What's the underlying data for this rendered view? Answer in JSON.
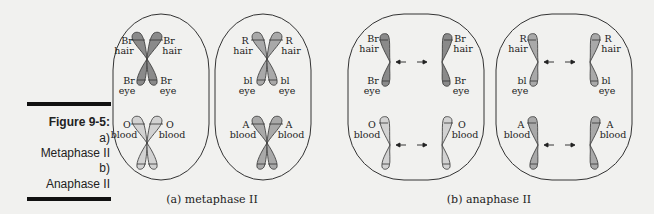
{
  "figure": {
    "number": "Figure 9-5:",
    "lines": [
      "a)",
      "Metaphase II",
      "b)",
      "Anaphase II"
    ]
  },
  "panels": {
    "metaphase": {
      "caption": "(a) metaphase II",
      "cells": [
        {
          "hair": [
            "Br",
            "hair"
          ],
          "eye": [
            "Br",
            "eye"
          ],
          "blood": [
            "O",
            "blood"
          ]
        },
        {
          "hair": [
            "R",
            "hair"
          ],
          "eye": [
            "bl",
            "eye"
          ],
          "blood": [
            "A",
            "blood"
          ]
        }
      ]
    },
    "anaphase": {
      "caption": "(b) anaphase II",
      "cells": [
        {
          "hair": [
            "Br",
            "hair"
          ],
          "eye": [
            "Br",
            "eye"
          ],
          "blood": [
            "O",
            "blood"
          ]
        },
        {
          "hair": [
            "R",
            "hair"
          ],
          "eye": [
            "bl",
            "eye"
          ],
          "blood": [
            "A",
            "blood"
          ]
        }
      ]
    }
  },
  "colors": {
    "dark_chromosome": "#8a8a8a",
    "light_chromosome": "#d2d2d2",
    "mid_chromosome": "#a9a9a9",
    "outline": "#333333"
  }
}
